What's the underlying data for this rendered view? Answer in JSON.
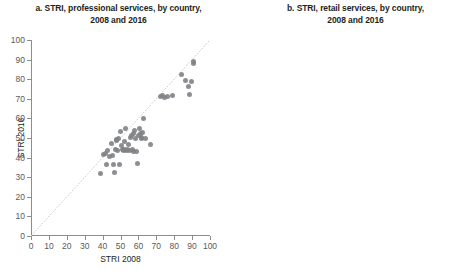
{
  "panels": [
    {
      "id": "a",
      "title_line1": "a. STRI, professional services, by country,",
      "title_line2": "2008 and 2016"
    },
    {
      "id": "b",
      "title_line1": "b. STRI, retail services, by country,",
      "title_line2": "2008 and 2016"
    }
  ],
  "axes": {
    "xlabel": "STRI 2008",
    "ylabel": "STRI 2016",
    "xticks": [
      "0",
      "10",
      "20",
      "30",
      "40",
      "50",
      "60",
      "70",
      "80",
      "90",
      "100"
    ],
    "yticks": [
      "0",
      "10",
      "20",
      "30",
      "40",
      "50",
      "60",
      "70",
      "80",
      "90",
      "100"
    ],
    "xlim": [
      0,
      100
    ],
    "ylim": [
      0,
      100
    ]
  },
  "colors": {
    "marker": "#808285",
    "axis": "#8d8d8d",
    "text": "#231f20",
    "tick_text": "#58595b",
    "diagonal": "#c9c9c9",
    "background": "#ffffff"
  },
  "chart_data": [
    {
      "type": "scatter",
      "title": "a. STRI, professional services, by country, 2008 and 2016",
      "xlabel": "STRI 2008",
      "ylabel": "STRI 2016",
      "xlim": [
        0,
        100
      ],
      "ylim": [
        0,
        100
      ],
      "grid": false,
      "legend": null,
      "annotations": [
        "45-degree reference line"
      ],
      "points": [
        [
          39.0,
          32.0
        ],
        [
          40.5,
          41.5
        ],
        [
          41.5,
          42.0
        ],
        [
          42.0,
          36.5
        ],
        [
          43.0,
          43.5
        ],
        [
          44.0,
          40.5
        ],
        [
          45.0,
          47.0
        ],
        [
          45.5,
          41.0
        ],
        [
          46.0,
          36.5
        ],
        [
          46.5,
          32.5
        ],
        [
          47.0,
          44.0
        ],
        [
          47.5,
          49.0
        ],
        [
          48.0,
          48.5
        ],
        [
          48.5,
          43.5
        ],
        [
          49.0,
          50.0
        ],
        [
          49.5,
          36.5
        ],
        [
          50.0,
          53.5
        ],
        [
          50.5,
          46.0
        ],
        [
          51.0,
          44.0
        ],
        [
          51.5,
          43.5
        ],
        [
          52.0,
          44.0
        ],
        [
          52.5,
          48.0
        ],
        [
          53.0,
          55.0
        ],
        [
          53.5,
          43.5
        ],
        [
          54.0,
          44.0
        ],
        [
          54.5,
          46.5
        ],
        [
          55.0,
          43.5
        ],
        [
          55.5,
          50.5
        ],
        [
          56.0,
          51.5
        ],
        [
          56.5,
          44.0
        ],
        [
          57.0,
          43.0
        ],
        [
          57.5,
          52.5
        ],
        [
          58.0,
          54.0
        ],
        [
          58.5,
          50.0
        ],
        [
          59.0,
          43.0
        ],
        [
          59.5,
          37.0
        ],
        [
          60.0,
          51.5
        ],
        [
          60.5,
          55.0
        ],
        [
          61.0,
          52.5
        ],
        [
          61.5,
          50.5
        ],
        [
          62.0,
          49.5
        ],
        [
          62.5,
          53.0
        ],
        [
          63.0,
          60.0
        ],
        [
          64.0,
          50.0
        ],
        [
          66.5,
          46.5
        ],
        [
          72.5,
          71.0
        ],
        [
          73.5,
          71.5
        ],
        [
          74.5,
          70.5
        ],
        [
          76.0,
          71.0
        ],
        [
          79.0,
          71.5
        ],
        [
          84.0,
          82.5
        ],
        [
          86.5,
          79.5
        ],
        [
          88.0,
          76.5
        ],
        [
          88.5,
          72.0
        ],
        [
          89.5,
          79.0
        ],
        [
          91.0,
          89.0
        ],
        [
          91.0,
          88.0
        ]
      ]
    },
    {
      "type": "scatter",
      "title": "b. STRI, retail services, by country, 2008 and 2016",
      "xlabel": "STRI 2008",
      "ylabel": "STRI 2016",
      "xlim": [
        0,
        100
      ],
      "ylim": [
        0,
        100
      ],
      "grid": false,
      "legend": null,
      "annotations": [
        "45-degree reference line"
      ],
      "points": [
        [
          25.0,
          25.5
        ],
        [
          25.5,
          26.5
        ],
        [
          25.5,
          36.0
        ],
        [
          26.0,
          12.5
        ],
        [
          26.0,
          27.0
        ],
        [
          26.5,
          28.0
        ],
        [
          27.0,
          28.5
        ],
        [
          29.5,
          31.0
        ],
        [
          30.0,
          31.5
        ],
        [
          30.5,
          32.0
        ],
        [
          31.5,
          32.0
        ],
        [
          32.0,
          33.0
        ],
        [
          33.0,
          33.5
        ],
        [
          34.0,
          34.5
        ],
        [
          35.5,
          36.0
        ],
        [
          36.0,
          32.5
        ],
        [
          37.0,
          32.5
        ],
        [
          37.5,
          37.5
        ],
        [
          38.0,
          38.5
        ],
        [
          38.5,
          39.0
        ],
        [
          39.5,
          39.5
        ],
        [
          40.0,
          40.0
        ],
        [
          42.5,
          42.5
        ],
        [
          44.5,
          45.0
        ],
        [
          52.5,
          33.5
        ],
        [
          53.0,
          33.0
        ],
        [
          53.5,
          52.5
        ],
        [
          54.0,
          53.5
        ],
        [
          54.5,
          54.0
        ],
        [
          55.0,
          55.0
        ],
        [
          55.5,
          53.5
        ],
        [
          55.5,
          56.5
        ],
        [
          56.0,
          54.0
        ],
        [
          56.0,
          36.5
        ],
        [
          56.5,
          55.0
        ],
        [
          57.0,
          57.0
        ],
        [
          57.5,
          53.5
        ],
        [
          58.0,
          55.5
        ],
        [
          60.0,
          62.0
        ],
        [
          65.0,
          74.0
        ],
        [
          100.0,
          100.0
        ]
      ]
    }
  ]
}
